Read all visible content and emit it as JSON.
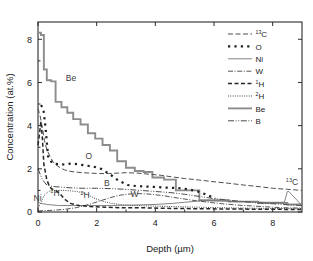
{
  "chart_data": {
    "type": "line",
    "title": "",
    "xlabel": "Depth (µm)",
    "ylabel": "Concentration (at.%)",
    "xlim": [
      0,
      9
    ],
    "ylim": [
      0,
      8.8
    ],
    "xticks": [
      "0",
      "2",
      "4",
      "6",
      "8"
    ],
    "xtick_values": [
      0,
      2,
      4,
      6,
      8
    ],
    "yticks": [
      "0",
      "2",
      "4",
      "6",
      "8"
    ],
    "ytick_values": [
      0,
      2,
      4,
      6,
      8
    ],
    "grid": false,
    "legend_position": "upper right",
    "series": [
      {
        "name": "13C",
        "label": "13C",
        "label_prefix": "13",
        "label_base": "C",
        "style": "dashed",
        "color": "#4d4d4d",
        "x": [
          0.0,
          0.08,
          0.15,
          0.22,
          0.3,
          0.4,
          0.5,
          0.6,
          0.75,
          0.9,
          1.1,
          1.3,
          1.5,
          1.8,
          2.1,
          2.4,
          2.7,
          3.0,
          3.4,
          3.8,
          4.2,
          4.6,
          5.0,
          5.5,
          6.0,
          6.5,
          7.0,
          7.5,
          8.0,
          8.5,
          9.0
        ],
        "y": [
          4.8,
          4.4,
          3.9,
          3.3,
          2.9,
          2.6,
          2.35,
          2.2,
          2.05,
          1.95,
          1.88,
          1.85,
          1.82,
          1.8,
          1.78,
          1.78,
          1.8,
          1.82,
          1.8,
          1.75,
          1.7,
          1.62,
          1.55,
          1.48,
          1.4,
          1.33,
          1.25,
          1.18,
          1.1,
          1.05,
          1.0
        ]
      },
      {
        "name": "O",
        "label": "O",
        "style": "dotted-squares",
        "color": "#1f1f1f",
        "x": [
          0.1,
          0.18,
          0.25,
          0.35,
          0.5,
          0.68,
          0.9,
          1.15,
          1.4,
          1.65,
          1.9,
          2.15,
          2.45,
          2.75,
          3.05,
          3.35,
          3.65,
          3.95,
          4.25,
          4.55,
          4.85,
          5.15,
          5.45,
          5.75,
          6.05
        ],
        "y": [
          4.95,
          4.8,
          4.0,
          2.5,
          2.25,
          2.22,
          2.2,
          2.25,
          2.2,
          2.15,
          2.1,
          2.0,
          1.75,
          1.45,
          1.25,
          1.2,
          1.18,
          1.16,
          1.14,
          1.12,
          1.1,
          1.05,
          0.95,
          0.8,
          0.62
        ]
      },
      {
        "name": "Ni",
        "label": "Ni",
        "style": "solid-thin",
        "color": "#6e6e6e",
        "x": [
          0.0,
          0.1,
          0.3,
          0.7,
          1.2,
          1.8,
          2.5,
          3.2,
          4.0,
          4.6,
          5.0,
          5.4,
          5.6,
          6.2,
          7.0,
          7.8,
          8.4,
          8.5,
          8.55,
          9.0
        ],
        "y": [
          0.45,
          0.4,
          0.35,
          0.3,
          0.3,
          0.3,
          0.3,
          0.32,
          0.35,
          0.4,
          0.45,
          0.5,
          0.52,
          0.5,
          0.48,
          0.45,
          0.45,
          0.95,
          0.95,
          0.3
        ]
      },
      {
        "name": "W",
        "label": "W",
        "style": "dash-dot",
        "color": "#555555",
        "x": [
          0.0,
          0.2,
          0.5,
          0.9,
          1.3,
          1.6,
          1.9,
          2.2,
          2.5,
          2.8,
          3.1,
          3.4,
          3.7,
          4.0,
          4.3,
          4.6,
          5.0,
          5.4,
          5.8,
          6.3,
          6.8,
          7.3,
          7.8,
          8.3,
          9.0
        ],
        "y": [
          0.05,
          0.06,
          0.08,
          0.12,
          0.2,
          0.3,
          0.42,
          0.55,
          0.68,
          0.78,
          0.83,
          0.85,
          0.84,
          0.8,
          0.75,
          0.68,
          0.6,
          0.52,
          0.45,
          0.38,
          0.32,
          0.28,
          0.24,
          0.2,
          0.18
        ]
      },
      {
        "name": "1H",
        "label": "1H",
        "label_prefix": "1",
        "label_base": "H",
        "style": "dashed-bold",
        "color": "#262626",
        "x": [
          0.0,
          0.05,
          0.1,
          0.15,
          0.2,
          0.3,
          0.4,
          0.5,
          0.6,
          0.75,
          0.9,
          1.1,
          1.4,
          1.8,
          2.3,
          2.8,
          3.4,
          4.0,
          4.8,
          5.6,
          6.5,
          7.5,
          8.5,
          9.0
        ],
        "y": [
          3.1,
          3.6,
          4.2,
          3.4,
          2.2,
          1.5,
          1.15,
          1.05,
          1.0,
          0.85,
          0.6,
          0.4,
          0.3,
          0.25,
          0.22,
          0.2,
          0.2,
          0.18,
          0.16,
          0.15,
          0.14,
          0.13,
          0.12,
          0.12
        ]
      },
      {
        "name": "2H",
        "label": "2H",
        "label_prefix": "2",
        "label_base": "H",
        "style": "fine-dotted",
        "color": "#454545",
        "x": [
          0.0,
          0.1,
          0.2,
          0.35,
          0.5,
          0.7,
          0.9,
          1.1,
          1.3,
          1.5,
          1.7,
          1.9,
          2.2,
          2.5,
          2.9,
          3.3,
          3.8,
          4.3,
          4.9,
          5.5,
          6.2,
          7.0,
          7.8,
          8.5,
          9.0
        ],
        "y": [
          0.2,
          0.4,
          0.75,
          0.95,
          1.0,
          1.0,
          1.0,
          0.98,
          0.95,
          0.9,
          0.8,
          0.65,
          0.5,
          0.4,
          0.33,
          0.3,
          0.28,
          0.26,
          0.24,
          0.22,
          0.2,
          0.18,
          0.17,
          0.16,
          0.15
        ]
      },
      {
        "name": "Be",
        "label": "Be",
        "style": "solid-thick",
        "color": "#8c8c8c",
        "x": [
          0.0,
          0.1,
          0.1,
          0.2,
          0.2,
          0.3,
          0.3,
          0.45,
          0.45,
          0.6,
          0.6,
          0.8,
          0.8,
          1.0,
          1.0,
          1.2,
          1.2,
          1.45,
          1.45,
          1.7,
          1.7,
          1.95,
          1.95,
          2.2,
          2.2,
          2.45,
          2.45,
          2.7,
          2.7,
          3.0,
          3.0,
          3.3,
          3.3,
          3.6,
          3.6,
          3.9,
          3.9,
          4.3,
          4.3,
          4.7,
          4.7,
          5.5,
          5.5,
          6.5,
          6.5,
          7.5,
          7.5,
          8.5,
          8.5,
          9.0
        ],
        "y": [
          8.3,
          8.3,
          8.2,
          8.2,
          6.6,
          6.6,
          6.1,
          6.1,
          6.05,
          6.05,
          5.1,
          5.1,
          4.85,
          4.85,
          4.6,
          4.6,
          4.3,
          4.3,
          4.05,
          4.05,
          3.65,
          3.65,
          3.4,
          3.4,
          3.1,
          3.1,
          2.85,
          2.85,
          2.35,
          2.35,
          2.05,
          2.05,
          1.9,
          1.9,
          1.85,
          1.85,
          1.6,
          1.6,
          1.5,
          1.5,
          1.0,
          1.0,
          0.55,
          0.55,
          0.48,
          0.48,
          0.42,
          0.42,
          0.35,
          0.35
        ]
      },
      {
        "name": "B",
        "label": "B",
        "style": "dash-dot-dot",
        "color": "#4a4a4a",
        "x": [
          0.0,
          0.15,
          0.3,
          0.5,
          0.8,
          1.1,
          1.5,
          2.0,
          2.5,
          3.0,
          3.5,
          4.0,
          4.5,
          5.0,
          5.5,
          6.0,
          6.5,
          7.0,
          7.5,
          8.0,
          8.5,
          9.0
        ],
        "y": [
          2.0,
          1.5,
          1.25,
          1.18,
          1.15,
          1.12,
          1.1,
          1.1,
          1.08,
          1.05,
          1.0,
          0.95,
          0.9,
          0.82,
          0.72,
          0.62,
          0.55,
          0.48,
          0.42,
          0.38,
          0.34,
          0.3
        ]
      }
    ],
    "legend": [
      {
        "label": "13C",
        "sup": "13",
        "base": "C",
        "style": "dashed",
        "color": "#4d4d4d"
      },
      {
        "label": "O",
        "sup": "",
        "base": "O",
        "style": "dotted-squares",
        "color": "#1f1f1f"
      },
      {
        "label": "Ni",
        "sup": "",
        "base": "Ni",
        "style": "solid-thin",
        "color": "#6e6e6e"
      },
      {
        "label": "W",
        "sup": "",
        "base": "W",
        "style": "dash-dot",
        "color": "#555555"
      },
      {
        "label": "1H",
        "sup": "1",
        "base": "H",
        "style": "dashed-bold",
        "color": "#262626"
      },
      {
        "label": "2H",
        "sup": "2",
        "base": "H",
        "style": "fine-dotted",
        "color": "#454545"
      },
      {
        "label": "Be",
        "sup": "",
        "base": "Be",
        "style": "solid-thick",
        "color": "#8c8c8c"
      },
      {
        "label": "B",
        "sup": "",
        "base": "B",
        "style": "dash-dot-dot",
        "color": "#4a4a4a"
      }
    ],
    "annotations": [
      {
        "name": "annotation-be",
        "sup": "",
        "base": "Be",
        "x": 0.95,
        "y": 6.05,
        "color": "#8c8c8c"
      },
      {
        "name": "annotation-o",
        "sup": "",
        "base": "O",
        "x": 1.62,
        "y": 2.45,
        "color": "#3d3d3d"
      },
      {
        "name": "annotation-b",
        "sup": "",
        "base": "B",
        "x": 2.25,
        "y": 1.22,
        "color": "#3d3d3d"
      },
      {
        "name": "annotation-ni",
        "sup": "",
        "base": "Ni",
        "x": -0.55,
        "y": 0.5,
        "color": "#7a7a7a"
      },
      {
        "name": "annotation-1h",
        "sup": "1",
        "base": "H",
        "x": 0.42,
        "y": 0.72,
        "color": "#3d3d3d"
      },
      {
        "name": "annotation-2h",
        "sup": "2",
        "base": "H",
        "x": 1.45,
        "y": 0.65,
        "color": "#3d3d3d"
      },
      {
        "name": "annotation-w",
        "sup": "",
        "base": "W",
        "x": 3.15,
        "y": 0.68,
        "color": "#3d3d3d"
      },
      {
        "name": "annotation-13c",
        "sup": "13",
        "base": "C",
        "x": 8.45,
        "y": 1.25,
        "color": "#3d3d3d"
      }
    ]
  }
}
